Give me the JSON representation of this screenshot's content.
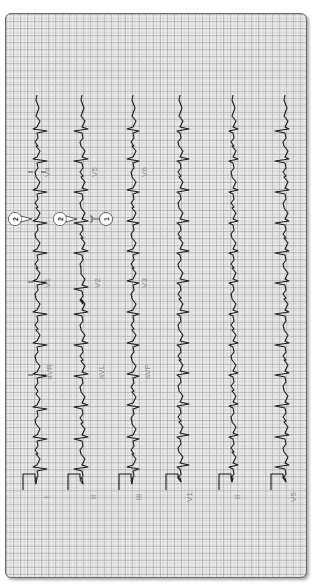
{
  "figure": {
    "colors": {
      "trace": "#1a1a1a",
      "grid_major": "#9a9a9a",
      "grid_minor": "#c8c8c8",
      "label": "#8a8a8a",
      "frame": "#6a6a6a"
    }
  },
  "strips": [
    {
      "x": 37,
      "calibration_label": "I",
      "segments": [
        {
          "lead": "I",
          "label_y": null
        },
        {
          "lead": "aVR",
          "label_y": 372
        },
        {
          "lead": "V1",
          "label_y": 282
        },
        {
          "lead": "V4",
          "label_y": 172
        }
      ],
      "beats": [
        468,
        438,
        408,
        375,
        344,
        313,
        282,
        252,
        222,
        191,
        160,
        130
      ],
      "qrs": [
        10,
        -4
      ],
      "markers": [
        375,
        282,
        172
      ]
    },
    {
      "x": 82,
      "calibration_label": "II",
      "segments": [
        {
          "lead": "II"
        },
        {
          "lead": "aVL",
          "label_y": 372
        },
        {
          "lead": "V2",
          "label_y": 282
        },
        {
          "lead": "V5",
          "label_y": 172
        }
      ],
      "beats": [
        468,
        438,
        406,
        375,
        344,
        313,
        288,
        252,
        222,
        191,
        160,
        130
      ],
      "qrs": [
        -8,
        6
      ],
      "markers": []
    },
    {
      "x": 133,
      "calibration_label": "III",
      "segments": [
        {
          "lead": "III"
        },
        {
          "lead": "aVF",
          "label_y": 372
        },
        {
          "lead": "V3",
          "label_y": 282
        },
        {
          "lead": "V6",
          "label_y": 172
        }
      ],
      "beats": [
        468,
        438,
        406,
        375,
        344,
        313,
        282,
        252,
        222,
        191,
        160,
        130
      ],
      "qrs": [
        6,
        -6
      ],
      "markers": []
    },
    {
      "x": 180,
      "calibration_label": "V1",
      "segments": [
        {
          "lead": "V1"
        }
      ],
      "beats": [
        466,
        436,
        405,
        374,
        344,
        313,
        282,
        252,
        222,
        191,
        160,
        130
      ],
      "qrs": [
        -3,
        9
      ],
      "markers": []
    },
    {
      "x": 233,
      "calibration_label": "II",
      "segments": [
        {
          "lead": "II"
        }
      ],
      "beats": [
        466,
        436,
        405,
        374,
        344,
        313,
        282,
        252,
        222,
        191,
        160,
        130
      ],
      "qrs": [
        -4,
        5
      ],
      "markers": []
    },
    {
      "x": 285,
      "calibration_label": "V5",
      "segments": [
        {
          "lead": "V5"
        }
      ],
      "beats": [
        466,
        436,
        405,
        374,
        344,
        313,
        282,
        252,
        222,
        191,
        160,
        130
      ],
      "qrs": [
        -10,
        4
      ],
      "markers": []
    }
  ],
  "mid_labels": [
    {
      "text": "aVR",
      "x": 52,
      "y": 372
    },
    {
      "text": "aVL",
      "x": 104,
      "y": 372
    },
    {
      "text": "aVF",
      "x": 150,
      "y": 372
    },
    {
      "text": "V1",
      "x": 50,
      "y": 283
    },
    {
      "text": "V2",
      "x": 100,
      "y": 283
    },
    {
      "text": "V3",
      "x": 147,
      "y": 283
    },
    {
      "text": "V4",
      "x": 50,
      "y": 172
    },
    {
      "text": "V5",
      "x": 97,
      "y": 172
    },
    {
      "text": "V6",
      "x": 147,
      "y": 172
    }
  ],
  "bottom_labels": [
    {
      "text": "I",
      "x": 49,
      "y": 497
    },
    {
      "text": "II",
      "x": 96,
      "y": 497
    },
    {
      "text": "III",
      "x": 141,
      "y": 497
    },
    {
      "text": "V1",
      "x": 192,
      "y": 497
    },
    {
      "text": "II",
      "x": 240,
      "y": 497
    },
    {
      "text": "V5",
      "x": 296,
      "y": 497
    }
  ],
  "callouts": [
    {
      "number": "2",
      "x": 15,
      "y": 219,
      "points_to_x": 32
    },
    {
      "number": "2",
      "x": 60,
      "y": 219,
      "points_to_x": 77
    },
    {
      "number": "1",
      "x": 106,
      "y": 219,
      "bracket_x": 90
    }
  ]
}
